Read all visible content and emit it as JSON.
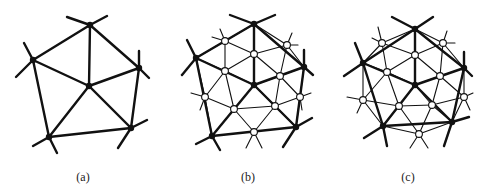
{
  "figure": {
    "panels": [
      {
        "id": "a",
        "label": "(a)",
        "label_x": 83,
        "black_vertices": [
          [
            90,
            25
          ],
          [
            33,
            60
          ],
          [
            139,
            68
          ],
          [
            89,
            86
          ],
          [
            49,
            137
          ],
          [
            131,
            128
          ]
        ],
        "thick_edges": [
          [
            0,
            1
          ],
          [
            0,
            2
          ],
          [
            0,
            3
          ],
          [
            1,
            3
          ],
          [
            2,
            3
          ],
          [
            1,
            4
          ],
          [
            3,
            4
          ],
          [
            3,
            5
          ],
          [
            2,
            5
          ],
          [
            4,
            5
          ]
        ],
        "white_vertices": [],
        "thin_edges": [],
        "stubs": [
          [
            0,
            67,
            17
          ],
          [
            0,
            107,
            16
          ],
          [
            1,
            24,
            43
          ],
          [
            1,
            16,
            77
          ],
          [
            2,
            139,
            51
          ],
          [
            2,
            149,
            78
          ],
          [
            4,
            33,
            146
          ],
          [
            4,
            57,
            153
          ],
          [
            5,
            147,
            120
          ],
          [
            5,
            118,
            148
          ]
        ]
      },
      {
        "id": "b",
        "label": "(b)",
        "label_x": 248,
        "black_vertices": [
          [
            254,
            24
          ],
          [
            196,
            58
          ],
          [
            304,
            67
          ],
          [
            254,
            85
          ],
          [
            212,
            136
          ],
          [
            296,
            127
          ]
        ],
        "thick_edges": [
          [
            0,
            1
          ],
          [
            0,
            2
          ],
          [
            0,
            3
          ],
          [
            1,
            3
          ],
          [
            2,
            3
          ],
          [
            1,
            4
          ],
          [
            3,
            4
          ],
          [
            3,
            5
          ],
          [
            2,
            5
          ],
          [
            4,
            5
          ]
        ],
        "white_vertices": [
          [
            225,
            41
          ],
          [
            287,
            45
          ],
          [
            254,
            54
          ],
          [
            225,
            71
          ],
          [
            280,
            76
          ],
          [
            205,
            97
          ],
          [
            234,
            109
          ],
          [
            275,
            106
          ],
          [
            300,
            97
          ],
          [
            254,
            132
          ]
        ],
        "thin_edges": [
          [
            0,
            2
          ],
          [
            0,
            3
          ],
          [
            1,
            4
          ],
          [
            1,
            6
          ],
          [
            1,
            8
          ],
          [
            1,
            9
          ],
          [
            2,
            3
          ],
          [
            2,
            4
          ],
          [
            2,
            0
          ],
          [
            3,
            5
          ],
          [
            3,
            6
          ],
          [
            4,
            7
          ],
          [
            4,
            8
          ],
          [
            5,
            6
          ],
          [
            6,
            7
          ],
          [
            7,
            8
          ],
          [
            6,
            9
          ],
          [
            7,
            9
          ],
          [
            5,
            9
          ]
        ],
        "stubs": [
          [
            0,
            230,
            15
          ],
          [
            0,
            275,
            15
          ],
          [
            1,
            187,
            40
          ],
          [
            1,
            182,
            75
          ],
          [
            2,
            304,
            50
          ],
          [
            2,
            313,
            75
          ],
          [
            4,
            196,
            144
          ],
          [
            4,
            220,
            150
          ],
          [
            5,
            312,
            118
          ],
          [
            5,
            283,
            147
          ]
        ],
        "white_stubs": [
          [
            0,
            220,
            29
          ],
          [
            0,
            212,
            37
          ],
          [
            1,
            292,
            33
          ],
          [
            1,
            298,
            45
          ],
          [
            5,
            191,
            93
          ],
          [
            5,
            200,
            110
          ],
          [
            8,
            311,
            93
          ],
          [
            8,
            302,
            110
          ],
          [
            9,
            246,
            148
          ],
          [
            9,
            262,
            148
          ]
        ]
      },
      {
        "id": "c",
        "label": "(c)",
        "label_x": 408,
        "black_vertices": [
          [
            415,
            29
          ],
          [
            363,
            63
          ],
          [
            464,
            68
          ],
          [
            415,
            85
          ],
          [
            383,
            126
          ],
          [
            452,
            122
          ]
        ],
        "thick_edges": [
          [
            0,
            1
          ],
          [
            0,
            2
          ],
          [
            0,
            3
          ],
          [
            1,
            3
          ],
          [
            2,
            3
          ],
          [
            1,
            4
          ],
          [
            3,
            4
          ],
          [
            3,
            5
          ],
          [
            2,
            5
          ],
          [
            4,
            5
          ]
        ],
        "white_vertices": [
          [
            382,
            43
          ],
          [
            443,
            43
          ],
          [
            415,
            55
          ],
          [
            387,
            72
          ],
          [
            440,
            76
          ],
          [
            363,
            100
          ],
          [
            399,
            106
          ],
          [
            432,
            105
          ],
          [
            464,
            97
          ],
          [
            419,
            134
          ]
        ],
        "thin_edges": [
          [
            0,
            2
          ],
          [
            0,
            3
          ],
          [
            1,
            4
          ],
          [
            1,
            6
          ],
          [
            1,
            8
          ],
          [
            1,
            9
          ],
          [
            2,
            3
          ],
          [
            2,
            4
          ],
          [
            3,
            5
          ],
          [
            3,
            6
          ],
          [
            4,
            7
          ],
          [
            4,
            8
          ],
          [
            5,
            6
          ],
          [
            6,
            7
          ],
          [
            7,
            8
          ],
          [
            6,
            9
          ],
          [
            7,
            9
          ],
          [
            5,
            9
          ],
          [
            0,
            1
          ]
        ],
        "stubs": [
          [
            0,
            392,
            17
          ],
          [
            0,
            433,
            17
          ],
          [
            1,
            355,
            43
          ],
          [
            1,
            344,
            76
          ],
          [
            2,
            464,
            52
          ],
          [
            2,
            472,
            76
          ],
          [
            4,
            364,
            138
          ],
          [
            4,
            387,
            146
          ],
          [
            5,
            469,
            117
          ],
          [
            5,
            444,
            146
          ]
        ],
        "white_stubs": [
          [
            0,
            378,
            27
          ],
          [
            0,
            372,
            38
          ],
          [
            1,
            447,
            31
          ],
          [
            1,
            455,
            43
          ],
          [
            5,
            347,
            97
          ],
          [
            5,
            357,
            113
          ],
          [
            8,
            473,
            93
          ],
          [
            8,
            470,
            110
          ],
          [
            9,
            410,
            148
          ],
          [
            9,
            428,
            148
          ]
        ]
      }
    ]
  },
  "colors": {
    "line": "#111111",
    "white_node_fill": "#ffffff",
    "label": "#222222"
  }
}
